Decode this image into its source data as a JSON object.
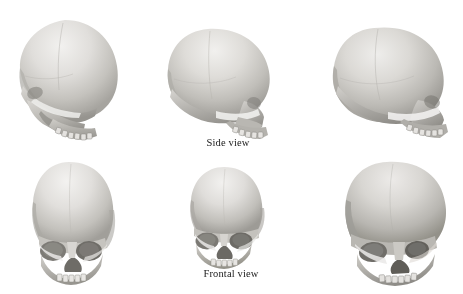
{
  "figure": {
    "background_color": "#ffffff",
    "width": 463,
    "height": 294,
    "ink_color": "#1a1a1a",
    "bone_light": "#e9e8e6",
    "bone_mid": "#c9c7c3",
    "bone_dark": "#8f8d89",
    "bone_shadow": "#6e6c68"
  },
  "captions": [
    {
      "id": "side-view",
      "text": "Side view"
    },
    {
      "id": "frontal-view",
      "text": "Frontal view"
    }
  ],
  "rows": [
    {
      "id": "row-side",
      "label": "Side view",
      "caption_ref": "captions.0.text",
      "specimens": [
        {
          "id": "side-left",
          "position": "left",
          "orientation": "lateral, facing left",
          "alt": "skull in left lateral profile, rounded high cranium"
        },
        {
          "id": "side-middle",
          "position": "middle",
          "orientation": "lateral, facing right",
          "alt": "skull in right lateral profile with maxilla and teeth visible"
        },
        {
          "id": "side-right",
          "position": "right",
          "orientation": "lateral, facing right, slight oblique",
          "alt": "skull in right lateral three-quarter profile"
        }
      ]
    },
    {
      "id": "row-frontal",
      "label": "Frontal view",
      "caption_ref": "captions.1.text",
      "specimens": [
        {
          "id": "frontal-left",
          "position": "left",
          "orientation": "anterior, slight left rotation",
          "alt": "skull seen from the front, tall vault, deep orbits"
        },
        {
          "id": "frontal-middle",
          "position": "middle",
          "orientation": "anterior",
          "alt": "skull seen from the front with nasal aperture and upper dentition"
        },
        {
          "id": "frontal-right",
          "position": "right",
          "orientation": "anterior oblique, three-quarter",
          "alt": "skull seen from the front, rotated three-quarters to the right"
        }
      ]
    }
  ],
  "layout": {
    "cells": [
      {
        "id": "side-left",
        "x": 5,
        "y": 14,
        "w": 128,
        "h": 128
      },
      {
        "id": "side-middle",
        "x": 158,
        "y": 23,
        "w": 122,
        "h": 118
      },
      {
        "id": "side-right",
        "x": 322,
        "y": 22,
        "w": 135,
        "h": 118
      },
      {
        "id": "frontal-left",
        "x": 17,
        "y": 158,
        "w": 112,
        "h": 128
      },
      {
        "id": "frontal-middle",
        "x": 178,
        "y": 164,
        "w": 96,
        "h": 106
      },
      {
        "id": "frontal-right",
        "x": 333,
        "y": 158,
        "w": 126,
        "h": 128
      }
    ],
    "caption_positions": [
      {
        "id": "side-view",
        "x": 178,
        "y": 137,
        "w": 100
      },
      {
        "id": "frontal-view",
        "x": 181,
        "y": 268,
        "w": 100
      }
    ]
  }
}
